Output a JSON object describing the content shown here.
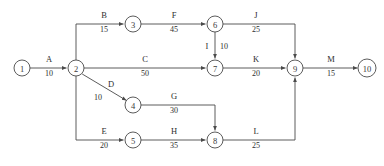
{
  "diagram": {
    "type": "activity-on-arrow-network",
    "title": "",
    "background_color": "#ffffff",
    "line_color": "#4a4a4a",
    "text_color": "#2e2e2e",
    "nodes": [
      {
        "id": "1",
        "label": "1",
        "x": 22,
        "y": 68,
        "r": 8
      },
      {
        "id": "2",
        "label": "2",
        "x": 76,
        "y": 68,
        "r": 8
      },
      {
        "id": "3",
        "label": "3",
        "x": 133,
        "y": 24,
        "r": 8
      },
      {
        "id": "4",
        "label": "4",
        "x": 133,
        "y": 105,
        "r": 8
      },
      {
        "id": "5",
        "label": "5",
        "x": 133,
        "y": 140,
        "r": 8
      },
      {
        "id": "6",
        "label": "6",
        "x": 215,
        "y": 24,
        "r": 8
      },
      {
        "id": "7",
        "label": "7",
        "x": 215,
        "y": 68,
        "r": 8
      },
      {
        "id": "8",
        "label": "8",
        "x": 215,
        "y": 140,
        "r": 8
      },
      {
        "id": "9",
        "label": "9",
        "x": 295,
        "y": 68,
        "r": 8
      },
      {
        "id": "10",
        "label": "10",
        "x": 367,
        "y": 68,
        "r": 9
      }
    ],
    "activities": [
      {
        "id": "A",
        "name": "A",
        "duration": "10",
        "from": "1",
        "to": "2",
        "name_x": 49,
        "name_y": 62,
        "dur_x": 49,
        "dur_y": 76
      },
      {
        "id": "B",
        "name": "B",
        "duration": "15",
        "from": "2",
        "to": "3",
        "name_x": 104,
        "name_y": 18,
        "dur_x": 104,
        "dur_y": 32
      },
      {
        "id": "C",
        "name": "C",
        "duration": "50",
        "from": "2",
        "to": "7",
        "name_x": 145,
        "name_y": 62,
        "dur_x": 145,
        "dur_y": 76
      },
      {
        "id": "D",
        "name": "D",
        "duration": "10",
        "from": "2",
        "to": "4",
        "name_x": 111,
        "name_y": 87,
        "dur_x": 98,
        "dur_y": 100
      },
      {
        "id": "E",
        "name": "E",
        "duration": "20",
        "from": "2",
        "to": "5",
        "name_x": 104,
        "name_y": 134,
        "dur_x": 104,
        "dur_y": 148
      },
      {
        "id": "F",
        "name": "F",
        "duration": "45",
        "from": "3",
        "to": "6",
        "name_x": 174,
        "name_y": 18,
        "dur_x": 174,
        "dur_y": 32
      },
      {
        "id": "G",
        "name": "G",
        "duration": "30",
        "from": "4",
        "to": "8",
        "name_x": 174,
        "name_y": 99,
        "dur_x": 174,
        "dur_y": 113
      },
      {
        "id": "H",
        "name": "H",
        "duration": "35",
        "from": "5",
        "to": "8",
        "name_x": 174,
        "name_y": 134,
        "dur_x": 174,
        "dur_y": 148
      },
      {
        "id": "I",
        "name": "I",
        "duration": "10",
        "from": "6",
        "to": "7",
        "name_x": 207,
        "name_y": 49,
        "dur_x": 222,
        "dur_y": 49
      },
      {
        "id": "J",
        "name": "J",
        "duration": "25",
        "from": "6",
        "to": "9",
        "name_x": 256,
        "name_y": 18,
        "dur_x": 256,
        "dur_y": 32
      },
      {
        "id": "K",
        "name": "K",
        "duration": "20",
        "from": "7",
        "to": "9",
        "name_x": 256,
        "name_y": 62,
        "dur_x": 256,
        "dur_y": 76
      },
      {
        "id": "L",
        "name": "L",
        "duration": "25",
        "from": "8",
        "to": "9",
        "name_x": 256,
        "name_y": 134,
        "dur_x": 256,
        "dur_y": 148
      },
      {
        "id": "M",
        "name": "M",
        "duration": "15",
        "from": "9",
        "to": "10",
        "name_x": 331,
        "name_y": 62,
        "dur_x": 331,
        "dur_y": 76
      }
    ]
  }
}
